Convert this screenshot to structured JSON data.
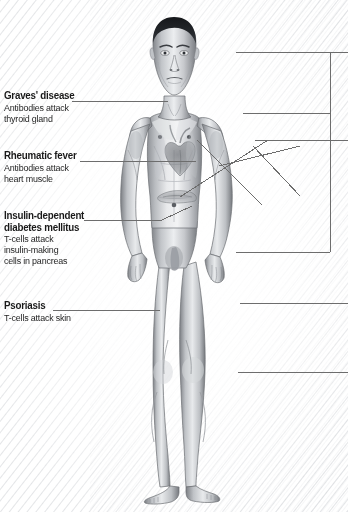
{
  "diagram": {
    "background_color": "#ffffff",
    "line_color": "#6d6d6d",
    "text_color": "#1a1a1a"
  },
  "labels": {
    "graves": {
      "title": "Graves' disease",
      "line1": "Antibodies attack",
      "line2": "thyroid gland"
    },
    "rheumatic": {
      "title": "Rheumatic fever",
      "line1": "Antibodies attack",
      "line2": "heart muscle"
    },
    "diabetes": {
      "title_line1": "Insulin-dependent",
      "title_line2": "diabetes mellitus",
      "line1": "T-cells attack",
      "line2": "insulin-making",
      "line3": "cells in pancreas"
    },
    "psoriasis": {
      "title": "Psoriasis",
      "line1": "T-cells attack skin"
    }
  },
  "leader_lines": [
    {
      "name": "graves-leader",
      "from_x": 72,
      "from_y": 101,
      "to_x": 168,
      "to_y": 101
    },
    {
      "name": "rheumatic-leader",
      "from_x": 80,
      "from_y": 161,
      "to_x": 196,
      "to_y": 161
    },
    {
      "name": "diabetes-leader",
      "from_x": 84,
      "from_y": 220,
      "to_x": 162,
      "to_y": 220
    },
    {
      "name": "diabetes-leader-2",
      "from_x": 162,
      "from_y": 220,
      "to_x": 192,
      "to_y": 206
    },
    {
      "name": "psoriasis-leader",
      "from_x": 53,
      "from_y": 310,
      "to_x": 160,
      "to_y": 310
    }
  ],
  "right_bracket": {
    "vertical_x": 330,
    "top_y": 52,
    "bottom_y": 252,
    "arms": [
      {
        "name": "right-arm-head",
        "y": 52,
        "x_start": 236,
        "x_end": 348
      },
      {
        "name": "right-arm-shoulder",
        "y": 113,
        "x_start": 243,
        "x_end": 330
      },
      {
        "name": "right-arm-arm",
        "y": 140,
        "x_start": 255,
        "x_end": 348
      },
      {
        "name": "right-arm-hand",
        "y": 252,
        "x_start": 236,
        "x_end": 330
      }
    ],
    "detached_arms": [
      {
        "name": "right-arm-hip",
        "y": 303,
        "x_start": 240,
        "x_end": 348
      },
      {
        "name": "right-arm-knee",
        "y": 372,
        "x_start": 238,
        "x_end": 348
      }
    ],
    "diagonals": [
      {
        "name": "arm-diagonal-a",
        "x1": 180,
        "y1": 197,
        "x2": 268,
        "y2": 140
      },
      {
        "name": "arm-diagonal-b",
        "x1": 197,
        "y1": 140,
        "x2": 262,
        "y2": 205
      },
      {
        "name": "arm-diagonal-c",
        "x1": 253,
        "y1": 146,
        "x2": 300,
        "y2": 196
      },
      {
        "name": "arm-diagonal-d",
        "x1": 219,
        "y1": 166,
        "x2": 300,
        "y2": 146
      }
    ]
  }
}
